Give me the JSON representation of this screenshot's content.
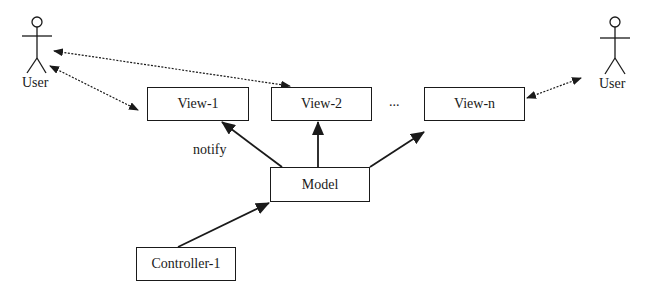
{
  "diagram": {
    "nodes": {
      "view1": "View-1",
      "view2": "View-2",
      "viewn": "View-n",
      "model": "Model",
      "controller": "Controller-1"
    },
    "actors": {
      "user_left": "User",
      "user_right": "User"
    },
    "labels": {
      "ellipsis": "...",
      "notify": "notify"
    },
    "edges": [
      {
        "from": "user_left",
        "to": "view1",
        "style": "dotted",
        "bidirectional": true
      },
      {
        "from": "user_left",
        "to": "view2",
        "style": "dotted",
        "bidirectional": true
      },
      {
        "from": "viewn",
        "to": "user_right",
        "style": "dotted",
        "bidirectional": true
      },
      {
        "from": "model",
        "to": "view1",
        "style": "solid",
        "label": "notify"
      },
      {
        "from": "model",
        "to": "view2",
        "style": "solid"
      },
      {
        "from": "model",
        "to": "viewn",
        "style": "solid"
      },
      {
        "from": "controller",
        "to": "model",
        "style": "solid"
      }
    ]
  }
}
